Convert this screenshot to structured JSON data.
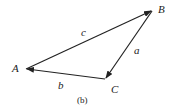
{
  "figure": {
    "caption": "(b)",
    "vertices": {
      "A": "A",
      "B": "B",
      "C": "C"
    },
    "edges": {
      "c": "c",
      "a": "a",
      "b": "b"
    },
    "color": "#222222"
  }
}
